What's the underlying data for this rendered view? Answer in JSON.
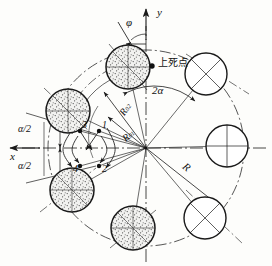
{
  "figure": {
    "kind": "engineering-diagram",
    "background_color": "#fdfdfb",
    "line_color": "#1a1a1a",
    "center": {
      "x": 146,
      "y": 148
    }
  },
  "axes": {
    "x_label": "x",
    "y_label": "y",
    "x_axis": {
      "y": 148,
      "x_start": 8,
      "x_end": 268
    },
    "y_axis": {
      "x": 146,
      "y_start": 10,
      "y_end": 262
    }
  },
  "angle_labels": {
    "phi": "φ",
    "two_alpha": "2α",
    "alpha_half_upper": "α/2",
    "alpha_half_lower": "α/2"
  },
  "radius_labels": {
    "R": "R",
    "R01_base": "R",
    "R01_sub": "01",
    "R02_base": "R",
    "R02_sub": "02"
  },
  "markers": {
    "top_dead_center": "上死点"
  },
  "point_labels": [
    "1",
    "2",
    "3",
    "4"
  ],
  "points": [
    {
      "id": "1",
      "label": "1",
      "x": 99,
      "y": 131,
      "label_x": 102,
      "label_y": 122
    },
    {
      "id": "2",
      "label": "2",
      "x": 99,
      "y": 166,
      "label_x": 102,
      "label_y": 164
    },
    {
      "id": "3",
      "label": "3",
      "x": 80,
      "y": 131,
      "label_x": 83,
      "label_y": 122
    },
    {
      "id": "4",
      "label": "4",
      "x": 80,
      "y": 166,
      "label_x": 74,
      "label_y": 164
    }
  ],
  "stations": {
    "hatched_fill": "#efefef",
    "hatched": [
      {
        "name": "station-top",
        "cx": 128,
        "cy": 67,
        "r": 22
      },
      {
        "name": "station-upper-left",
        "cx": 68,
        "cy": 111,
        "r": 22
      },
      {
        "name": "station-lower-left",
        "cx": 72,
        "cy": 190,
        "r": 22
      },
      {
        "name": "station-bottom",
        "cx": 133,
        "cy": 228,
        "r": 22
      }
    ],
    "plain": [
      {
        "name": "station-upper-right",
        "cx": 206,
        "cy": 74,
        "r": 21
      },
      {
        "name": "station-right",
        "cx": 227,
        "cy": 146,
        "r": 21
      },
      {
        "name": "station-lower-right",
        "cx": 205,
        "cy": 218,
        "r": 21
      }
    ]
  },
  "circles": {
    "bolt_circle_radius": 98,
    "inner_arc_radius": 76,
    "outer_arc_radius": 88
  }
}
